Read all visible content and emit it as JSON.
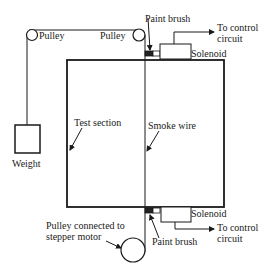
{
  "labels": {
    "pulley_left": "Pulley",
    "pulley_right": "Pulley",
    "paint_brush_top": "Paint brush",
    "to_control_top_1": "To control",
    "to_control_top_2": "circuit",
    "solenoid_top": "Solenoid",
    "weight": "Weight",
    "test_section": "Test section",
    "smoke_wire": "Smoke wire",
    "to_control_bottom_1": "To control",
    "to_control_bottom_2": "circuit",
    "solenoid_bottom": "Solenoid",
    "pulley_motor_1": "Pulley connected to",
    "pulley_motor_2": "stepper motor",
    "paint_brush_bottom": "Paint brush"
  },
  "colors": {
    "line": "#1a1a1a",
    "brush": "#222222",
    "background": "#ffffff"
  }
}
